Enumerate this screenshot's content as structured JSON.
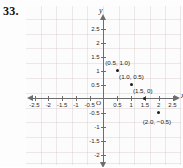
{
  "exercise": {
    "number": "33."
  },
  "chart_data": {
    "type": "scatter",
    "title": "",
    "xlabel": "x",
    "ylabel": "y",
    "origin_label": "O",
    "grid": true,
    "legend": "none",
    "xlim": [
      -2.75,
      2.75
    ],
    "ylim": [
      -2.75,
      2.75
    ],
    "xticks": [
      -2.5,
      -2,
      -1.5,
      -1,
      -0.5,
      0.5,
      1,
      1.5,
      2,
      2.5
    ],
    "yticks": [
      2.5,
      2,
      1.5,
      1,
      0.5,
      -0.5,
      -1,
      -1.5,
      -2,
      -2.5
    ],
    "xtick_labels": [
      "-2.5",
      "-2",
      "-1.5",
      "-1",
      "-0.5",
      "0.5",
      "1",
      "1.5",
      "2",
      "2.5"
    ],
    "ytick_labels": [
      "2.5",
      "2",
      "1.5",
      "1",
      "0.5",
      "-0.5",
      "-1",
      "-1.5",
      "-2",
      "-2.5"
    ],
    "points": [
      {
        "x": 0.5,
        "y": 1.0,
        "label": "(0.5, 1.0)"
      },
      {
        "x": 1.0,
        "y": 0.5,
        "label": "(1.0, 0.5)"
      },
      {
        "x": 1.5,
        "y": 0.0,
        "label": "(1.5, 0)"
      },
      {
        "x": 2.0,
        "y": -0.5,
        "label": "(2.0, −0.5)"
      }
    ]
  },
  "colors": {
    "axis": "#6d6d6d",
    "grid": "#cdbaba",
    "point": "#1b1b1b",
    "text": "#2a2a2a",
    "background": "#fefdfd"
  }
}
